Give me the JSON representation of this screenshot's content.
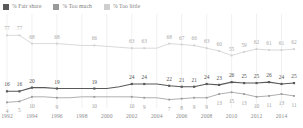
{
  "legend": {
    "items": [
      {
        "label": "% Fair share",
        "color": "#595959",
        "key": "fair"
      },
      {
        "label": "% Too much",
        "color": "#9a9a9a",
        "key": "much"
      },
      {
        "label": "% Too little",
        "color": "#cfcfcf",
        "key": "little"
      }
    ]
  },
  "axis": {
    "tick_labels": [
      "1992",
      "1994",
      "1996",
      "1998",
      "2000",
      "2002",
      "2004",
      "2006",
      "2008",
      "2010",
      "2012",
      "2014"
    ]
  },
  "chart_data": {
    "type": "line",
    "title": "",
    "subtitle": "",
    "xlabel": "",
    "ylabel": "",
    "ylim": [
      0,
      85
    ],
    "grid": "vertical",
    "legend_position": "top-left",
    "x": [
      1992,
      1993,
      1994,
      1995,
      1996,
      1997,
      1998,
      1999,
      2000,
      2001,
      2002,
      2003,
      2004,
      2005,
      2006,
      2007,
      2008,
      2009,
      2010,
      2011,
      2012,
      2013,
      2014,
      2015
    ],
    "xtick_labels": [
      "1992",
      "1994",
      "1996",
      "1998",
      "2000",
      "2002",
      "2004",
      "2006",
      "2008",
      "2010",
      "2012",
      "2014"
    ],
    "series": [
      {
        "name": "% Fair share",
        "color": "#595959",
        "values": [
          16,
          16,
          20,
          20,
          19,
          19,
          19,
          19,
          19,
          21,
          24,
          24,
          24,
          22,
          21,
          21,
          24,
          23,
          26,
          25,
          25,
          26,
          24,
          25
        ],
        "labels": [
          {
            "x": 1992,
            "value": 16
          },
          {
            "x": 1993,
            "value": 16
          },
          {
            "x": 1994,
            "value": 20
          },
          {
            "x": 1996,
            "value": 19
          },
          {
            "x": 1999,
            "value": 19
          },
          {
            "x": 2002,
            "value": 24
          },
          {
            "x": 2003,
            "value": 24
          },
          {
            "x": 2005,
            "value": 22
          },
          {
            "x": 2006,
            "value": 21
          },
          {
            "x": 2007,
            "value": 21
          },
          {
            "x": 2008,
            "value": 24
          },
          {
            "x": 2009,
            "value": 23
          },
          {
            "x": 2010,
            "value": 26
          },
          {
            "x": 2011,
            "value": 25
          },
          {
            "x": 2012,
            "value": 25
          },
          {
            "x": 2013,
            "value": 26
          },
          {
            "x": 2014,
            "value": 24
          },
          {
            "x": 2015,
            "value": 25
          }
        ]
      },
      {
        "name": "% Too much",
        "color": "#9a9a9a",
        "values": [
          4,
          5,
          10,
          10,
          9,
          9,
          10,
          10,
          10,
          10,
          10,
          9,
          9,
          7,
          8,
          9,
          9,
          13,
          15,
          13,
          10,
          11,
          13,
          11
        ],
        "labels": [
          {
            "x": 1992,
            "value": 4
          },
          {
            "x": 1993,
            "value": 5
          },
          {
            "x": 1994,
            "value": 10
          },
          {
            "x": 1996,
            "value": 9
          },
          {
            "x": 1999,
            "value": 10
          },
          {
            "x": 2002,
            "value": 10
          },
          {
            "x": 2003,
            "value": 9
          },
          {
            "x": 2005,
            "value": 7
          },
          {
            "x": 2006,
            "value": 8
          },
          {
            "x": 2007,
            "value": 9
          },
          {
            "x": 2008,
            "value": 9
          },
          {
            "x": 2009,
            "value": 13
          },
          {
            "x": 2010,
            "value": 15
          },
          {
            "x": 2011,
            "value": 13
          },
          {
            "x": 2012,
            "value": 10
          },
          {
            "x": 2013,
            "value": 11
          },
          {
            "x": 2014,
            "value": 13
          },
          {
            "x": 2015,
            "value": 11
          }
        ]
      },
      {
        "name": "% Too little",
        "color": "#cfcfcf",
        "values": [
          77,
          77,
          68,
          68,
          68,
          67,
          66,
          66,
          65,
          64,
          63,
          63,
          63,
          68,
          67,
          66,
          63,
          60,
          55,
          59,
          62,
          61,
          61,
          62
        ],
        "labels": [
          {
            "x": 1992,
            "value": 77
          },
          {
            "x": 1993,
            "value": 77
          },
          {
            "x": 1994,
            "value": 68
          },
          {
            "x": 1996,
            "value": 68
          },
          {
            "x": 1999,
            "value": 66
          },
          {
            "x": 2002,
            "value": 63
          },
          {
            "x": 2003,
            "value": 63
          },
          {
            "x": 2005,
            "value": 68
          },
          {
            "x": 2006,
            "value": 67
          },
          {
            "x": 2007,
            "value": 66
          },
          {
            "x": 2008,
            "value": 63
          },
          {
            "x": 2009,
            "value": 60
          },
          {
            "x": 2010,
            "value": 55
          },
          {
            "x": 2011,
            "value": 59
          },
          {
            "x": 2012,
            "value": 62
          },
          {
            "x": 2013,
            "value": 61
          },
          {
            "x": 2014,
            "value": 61
          },
          {
            "x": 2015,
            "value": 62
          }
        ]
      }
    ]
  }
}
